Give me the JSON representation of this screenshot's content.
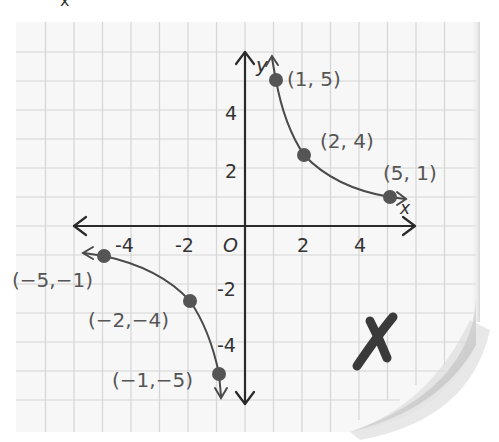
{
  "top_glyph": "x",
  "axes": {
    "x_label": "x",
    "y_label": "y",
    "origin_label": "O",
    "x_ticks": [
      {
        "value": -4,
        "label": "-4"
      },
      {
        "value": -2,
        "label": "-2"
      },
      {
        "value": 2,
        "label": "2"
      },
      {
        "value": 4,
        "label": "4"
      }
    ],
    "y_ticks": [
      {
        "value": 4,
        "label": "4"
      },
      {
        "value": 2,
        "label": "2"
      },
      {
        "value": -2,
        "label": "-2"
      },
      {
        "value": -4,
        "label": "-4"
      }
    ]
  },
  "points": [
    {
      "label": "(1, 5)"
    },
    {
      "label": "(2, 4)"
    },
    {
      "label": "(5, 1)"
    },
    {
      "label": "(−5,−1)"
    },
    {
      "label": "(−2,−4)"
    },
    {
      "label": "(−1,−5)"
    }
  ],
  "mark": "✗",
  "colors": {
    "grid": "#d4d4d4",
    "axis": "#2a2a2a",
    "curve": "#4a4a4a",
    "dot": "#555555",
    "text": "#555555"
  }
}
